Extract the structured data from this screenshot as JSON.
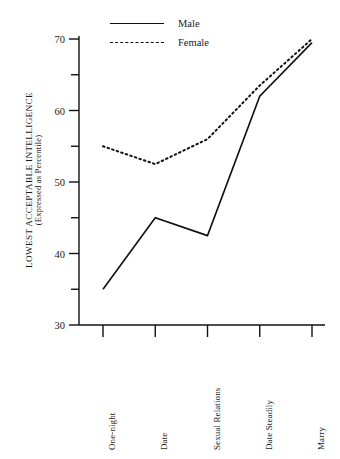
{
  "chart_data": {
    "type": "line",
    "title": "",
    "xlabel": "",
    "ylabel": "LOWEST ACCEPTABLE INTELLIGENCE",
    "ylabel_sub": "(Expressed as Percentile)",
    "categories": [
      "One-night",
      "Date",
      "Sexual Relations",
      "Date Steadily",
      "Marry"
    ],
    "ylim": [
      30,
      70
    ],
    "yticks": [
      30,
      40,
      50,
      60,
      70
    ],
    "yticks_minor": [
      35,
      45,
      55,
      65
    ],
    "ytick_labels": [
      "30",
      "40",
      "50",
      "60",
      "70"
    ],
    "grid": false,
    "legend_position": "top-center",
    "series": [
      {
        "name": "Male",
        "style": "solid",
        "color": "#111111",
        "values": [
          35,
          45,
          42.5,
          62,
          69.5
        ]
      },
      {
        "name": "Female",
        "style": "dashed",
        "color": "#111111",
        "values": [
          55,
          52.5,
          56,
          63.5,
          70
        ]
      }
    ]
  },
  "legend": {
    "items": [
      {
        "label": "Male",
        "style": "solid"
      },
      {
        "label": "Female",
        "style": "dashed"
      }
    ]
  },
  "axes": {
    "y_title_main": "LOWEST ACCEPTABLE INTELLIGENCE",
    "y_title_sub": "(Expressed as Percentile)"
  }
}
